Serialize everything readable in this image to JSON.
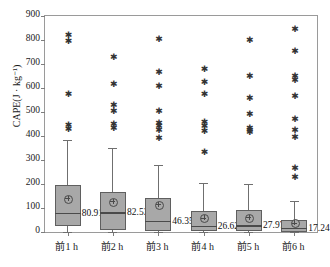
{
  "chart_data": {
    "type": "box",
    "title": "",
    "xlabel": "",
    "ylabel": "CAPE(J · kg⁻¹)",
    "ylim": [
      0,
      900
    ],
    "yticks": [
      900,
      800,
      700,
      600,
      500,
      400,
      300,
      200,
      100,
      0
    ],
    "grid": false,
    "legend": "none",
    "categories": [
      "前1 h",
      "前2 h",
      "前3 h",
      "前4 h",
      "前5 h",
      "前6 h"
    ],
    "median_labels": [
      "80.91",
      "82.53",
      "46.35",
      "26.62",
      "27.97",
      "17.24"
    ],
    "boxes": [
      {
        "category": "前1 h",
        "whisker_low": 0,
        "q1": 25,
        "median": 80.91,
        "mean": 140,
        "q3": 197,
        "whisker_high": 385,
        "outliers": [
          820,
          795,
          575,
          445,
          430
        ]
      },
      {
        "category": "前2 h",
        "whisker_low": 0,
        "q1": 8,
        "median": 82.53,
        "mean": 128,
        "q3": 168,
        "whisker_high": 350,
        "outliers": [
          730,
          615,
          530,
          505,
          450,
          435
        ]
      },
      {
        "category": "前3 h",
        "whisker_low": 0,
        "q1": 5,
        "median": 46.35,
        "mean": 115,
        "q3": 140,
        "whisker_high": 278,
        "outliers": [
          805,
          665,
          610,
          505,
          455,
          440,
          425,
          390
        ]
      },
      {
        "category": "前4 h",
        "whisker_low": 0,
        "q1": 3,
        "median": 26.62,
        "mean": 60,
        "q3": 88,
        "whisker_high": 205,
        "outliers": [
          680,
          625,
          575,
          460,
          440,
          420,
          335
        ]
      },
      {
        "category": "前5 h",
        "whisker_low": 0,
        "q1": 3,
        "median": 27.97,
        "mean": 62,
        "q3": 90,
        "whisker_high": 200,
        "outliers": [
          800,
          650,
          560,
          490,
          435,
          425,
          415
        ]
      },
      {
        "category": "前6 h",
        "whisker_low": 0,
        "q1": 2,
        "median": 17.24,
        "mean": 38,
        "q3": 52,
        "whisker_high": 130,
        "outliers": [
          845,
          755,
          650,
          635,
          565,
          470,
          425,
          395,
          265,
          230
        ]
      }
    ],
    "colors": {
      "box_fill": "#a8a8a8",
      "box_edge": "#5f5f5f",
      "median_line": "#4a4a4a",
      "axis": "#9a9a9a",
      "text": "#1a1a1a"
    }
  }
}
